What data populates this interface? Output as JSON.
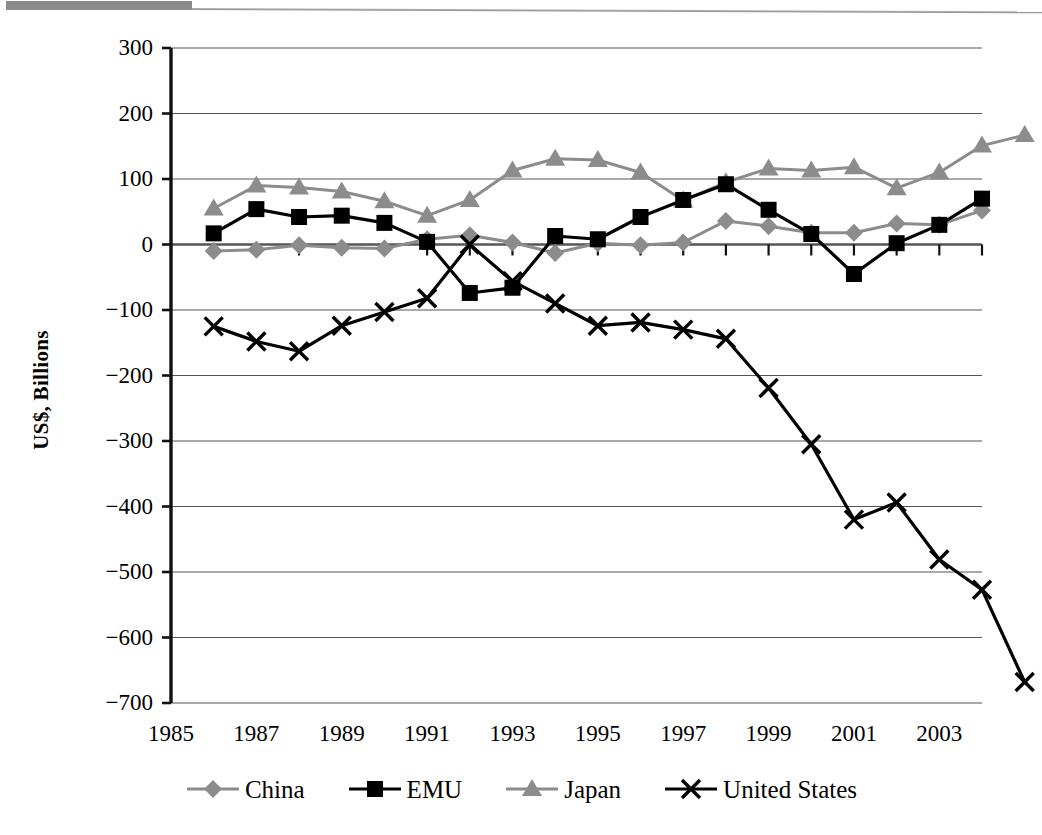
{
  "figure": {
    "ylabel": "US$, Billions",
    "top_bar_color": "#8a8a8a"
  },
  "chart_data": {
    "type": "line",
    "title": "",
    "xlabel": "",
    "ylabel": "US$, Billions",
    "xlim": [
      1985,
      2004
    ],
    "ylim": [
      -700,
      300
    ],
    "ytick_step": 100,
    "xtick_step": 2,
    "grid": true,
    "legend_position": "bottom",
    "x": [
      1986,
      1987,
      1988,
      1989,
      1990,
      1991,
      1992,
      1993,
      1994,
      1995,
      1996,
      1997,
      1998,
      1999,
      2000,
      2001,
      2002,
      2003,
      2004
    ],
    "yticks": [
      300,
      200,
      100,
      0,
      -100,
      -200,
      -300,
      -400,
      -500,
      -600,
      -700
    ],
    "ytick_labels": [
      "300",
      "200",
      "100",
      "0",
      "−100",
      "−200",
      "−300",
      "−400",
      "−500",
      "−600",
      "−700"
    ],
    "xticks": [
      1985,
      1987,
      1989,
      1991,
      1993,
      1995,
      1997,
      1999,
      2001,
      2003
    ],
    "xtick_labels": [
      "1985",
      "1987",
      "1989",
      "1991",
      "1993",
      "1995",
      "1997",
      "1999",
      "2001",
      "2003"
    ],
    "series": [
      {
        "name": "China",
        "marker": "diamond",
        "color": "#8c8c8c",
        "values": [
          -10,
          -8,
          -1,
          -5,
          -6,
          8,
          14,
          3,
          -13,
          2,
          -1,
          3,
          36,
          28,
          18,
          18,
          32,
          30,
          52
        ]
      },
      {
        "name": "EMU",
        "marker": "square",
        "color": "#000000",
        "values": [
          17,
          54,
          42,
          44,
          33,
          4,
          -74,
          -66,
          13,
          8,
          42,
          68,
          92,
          53,
          16,
          -45,
          2,
          30,
          70
        ]
      },
      {
        "name": "Japan",
        "marker": "triangle",
        "color": "#8c8c8c",
        "values": [
          55,
          90,
          87,
          81,
          66,
          44,
          68,
          113,
          131,
          129,
          110,
          67,
          95,
          116,
          113,
          118,
          86,
          110,
          151
        ]
      },
      {
        "name": "United States",
        "marker": "x",
        "color": "#000000",
        "values": [
          -125,
          -148,
          -163,
          -124,
          -103,
          -82,
          0,
          -56,
          -90,
          -124,
          -119,
          -130,
          -144,
          -219,
          -305,
          -420,
          -394,
          -481,
          -527
        ]
      }
    ],
    "series_tail": {
      "Japan": 167,
      "United States": -668
    }
  },
  "legend": {
    "entries": [
      {
        "label": "China",
        "marker": "diamond",
        "color": "#8c8c8c"
      },
      {
        "label": "EMU",
        "marker": "square",
        "color": "#000000"
      },
      {
        "label": "Japan",
        "marker": "triangle",
        "color": "#8c8c8c"
      },
      {
        "label": "United States",
        "marker": "x",
        "color": "#000000"
      }
    ]
  }
}
